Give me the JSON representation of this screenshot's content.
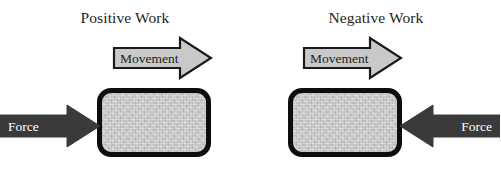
{
  "diagram": {
    "title_hidden": "Positive and Negative Work",
    "colors": {
      "background": "#ffffff",
      "box_fill": "#c2c2c2",
      "box_border": "#0d0d0d",
      "movement_arrow_fill": "#c9c9c9",
      "movement_arrow_stroke": "#1a1a1a",
      "force_arrow_fill": "#3a3a3a",
      "force_arrow_text": "#ffffff",
      "title_text": "#231f20"
    }
  },
  "panels": [
    {
      "id": "positive",
      "title": "Positive Work",
      "movement": {
        "label": "Movement",
        "direction": "right",
        "icon": "block-arrow-right-icon"
      },
      "force": {
        "label": "Force",
        "direction": "right",
        "icon": "block-arrow-right-icon"
      },
      "body": {
        "icon": "rounded-rectangle-block"
      }
    },
    {
      "id": "negative",
      "title": "Negative Work",
      "movement": {
        "label": "Movement",
        "direction": "right",
        "icon": "block-arrow-right-icon"
      },
      "force": {
        "label": "Force",
        "direction": "left",
        "icon": "block-arrow-left-icon"
      },
      "body": {
        "icon": "rounded-rectangle-block"
      }
    }
  ]
}
